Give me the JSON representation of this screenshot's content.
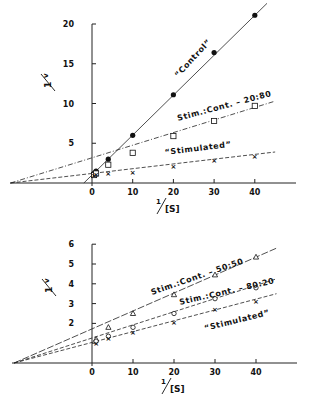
{
  "chart_data": [
    {
      "type": "line",
      "title": "",
      "xlabel": "1/[S]",
      "ylabel": "1/v",
      "xlim": [
        -20,
        50
      ],
      "ylim": [
        0,
        20
      ],
      "xticks": [
        0,
        10,
        20,
        30,
        40
      ],
      "yticks": [
        5,
        10,
        15,
        20
      ],
      "grid": false,
      "legend": "inline labels along lines",
      "series": [
        {
          "name": "“Control”",
          "marker": "filled-circle",
          "line_style": "solid",
          "x": [
            0.5,
            1,
            4,
            10,
            20,
            30,
            40
          ],
          "y": [
            1.2,
            1.5,
            3.0,
            6.0,
            11.1,
            16.4,
            21.1
          ],
          "fit_line": {
            "x": [
              -2,
              43
            ],
            "y": [
              0,
              22.6
            ]
          }
        },
        {
          "name": "Stim.:Cont. – 20:80",
          "marker": "open-square",
          "line_style": "dash-dot",
          "x": [
            0.5,
            1,
            4,
            10,
            20,
            30,
            40
          ],
          "y": [
            1.0,
            1.2,
            2.3,
            3.8,
            5.9,
            7.8,
            9.7
          ],
          "fit_line": {
            "x": [
              -20,
              45
            ],
            "y": [
              0,
              10.3
            ]
          }
        },
        {
          "name": "“Stimulated”",
          "marker": "x",
          "line_style": "dashed",
          "x": [
            0.5,
            1,
            4,
            10,
            20,
            30,
            40
          ],
          "y": [
            1.0,
            1.1,
            1.2,
            1.3,
            2.1,
            2.8,
            3.3
          ],
          "fit_line": {
            "x": [
              -20,
              45
            ],
            "y": [
              0,
              3.9
            ]
          }
        }
      ]
    },
    {
      "type": "line",
      "title": "",
      "xlabel": "1/[S]",
      "ylabel": "1/v",
      "xlim": [
        -20,
        50
      ],
      "ylim": [
        0,
        6
      ],
      "xticks": [
        0,
        10,
        20,
        30,
        40
      ],
      "yticks": [
        1,
        2,
        3,
        4,
        5,
        6
      ],
      "ytick_labels_shown": [
        2,
        3,
        4,
        5,
        6
      ],
      "grid": false,
      "legend": "inline labels along lines",
      "series": [
        {
          "name": "Stim.:Cont. – 50:50",
          "marker": "open-triangle",
          "line_style": "long-dash",
          "x": [
            1,
            4,
            10,
            20,
            30,
            40
          ],
          "y": [
            1.2,
            1.8,
            2.5,
            3.45,
            4.45,
            5.35
          ],
          "fit_line": {
            "x": [
              -19,
              45
            ],
            "y": [
              0,
              5.8
            ]
          }
        },
        {
          "name": "Stim.:Cont. – 80:20",
          "marker": "open-circle",
          "line_style": "dashed",
          "x": [
            1,
            4,
            10,
            20,
            30,
            40
          ],
          "y": [
            1.1,
            1.35,
            1.8,
            2.5,
            3.25,
            3.8
          ],
          "fit_line": {
            "x": [
              -19,
              45
            ],
            "y": [
              0,
              4.25
            ]
          }
        },
        {
          "name": "“Stimulated”",
          "marker": "x",
          "line_style": "dashed",
          "x": [
            1,
            4,
            10,
            20,
            30,
            40
          ],
          "y": [
            1.0,
            1.25,
            1.55,
            2.05,
            2.7,
            3.1
          ],
          "fit_line": {
            "x": [
              -19,
              45
            ],
            "y": [
              0,
              3.5
            ]
          }
        }
      ]
    }
  ],
  "figure": {
    "top": {
      "ylabel_num": "1",
      "ylabel_den": "v",
      "xlabel_num": "1",
      "xlabel_den": "[S]",
      "labels": {
        "control": "“Control”",
        "mix": "Stim.:Cont. – 20:80",
        "stim": "“Stimulated”"
      }
    },
    "bottom": {
      "ylabel_num": "1",
      "ylabel_den": "v",
      "xlabel_num": "1",
      "xlabel_den": "[S]",
      "labels": {
        "mix5050": "Stim.:Cont. – 50:50",
        "mix8020": "Stim.:Cont. – 80:20",
        "stim": "“Stimulated”"
      }
    }
  }
}
